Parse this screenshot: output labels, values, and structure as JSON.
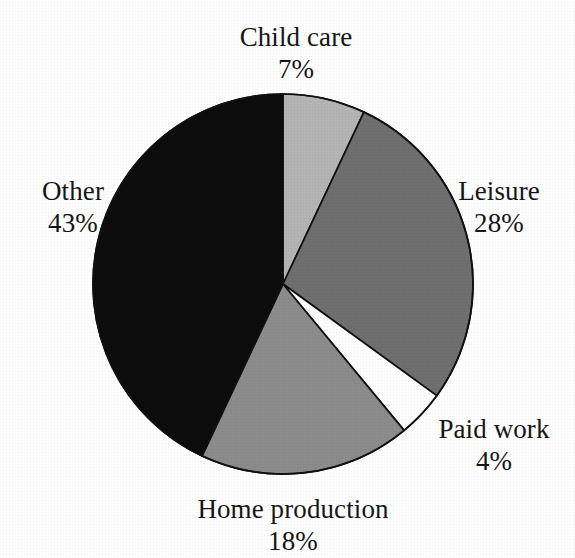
{
  "background_color": "#ffffff",
  "chart_data": {
    "type": "pie",
    "title": "",
    "subtitle": "",
    "xlabel": "",
    "ylabel": "",
    "legend_position": "none",
    "grid": false,
    "labels_outside": true,
    "start_angle_deg": 0,
    "direction": "clockwise",
    "units": "percent",
    "total": 100,
    "categories": [
      "Child care",
      "Leisure",
      "Paid work",
      "Home production",
      "Other"
    ],
    "values": [
      7,
      28,
      4,
      18,
      43
    ],
    "value_labels": [
      "7%",
      "28%",
      "4%",
      "18%",
      "43%"
    ],
    "colors": [
      "#b5b5b5",
      "#707070",
      "#ffffff",
      "#8c8c8c",
      "#0d0d0d"
    ],
    "slice_stroke_color": "#111111",
    "slices": [
      {
        "name": "Child care",
        "value": 7,
        "value_label": "7%",
        "color": "#b5b5b5",
        "start_deg": 0,
        "end_deg": 25.2,
        "label_position": "top"
      },
      {
        "name": "Leisure",
        "value": 28,
        "value_label": "28%",
        "color": "#707070",
        "start_deg": 25.2,
        "end_deg": 126.0,
        "label_position": "right"
      },
      {
        "name": "Paid work",
        "value": 4,
        "value_label": "4%",
        "color": "#ffffff",
        "start_deg": 126.0,
        "end_deg": 140.4,
        "label_position": "bottom-right"
      },
      {
        "name": "Home production",
        "value": 18,
        "value_label": "18%",
        "color": "#8c8c8c",
        "start_deg": 140.4,
        "end_deg": 205.2,
        "label_position": "bottom"
      },
      {
        "name": "Other",
        "value": 43,
        "value_label": "43%",
        "color": "#0d0d0d",
        "start_deg": 205.2,
        "end_deg": 360.0,
        "label_position": "left"
      }
    ],
    "geometry": {
      "center_x": 283,
      "center_y": 284,
      "radius": 190
    }
  }
}
